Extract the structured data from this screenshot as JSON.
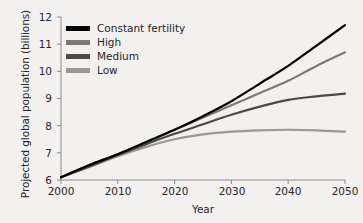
{
  "chart_data": {
    "type": "line",
    "title": "",
    "xlabel": "Year",
    "ylabel": "Projected global population (billions)",
    "xlim": [
      2000,
      2050
    ],
    "ylim": [
      6,
      12
    ],
    "xticks": [
      "2000",
      "2010",
      "2020",
      "2030",
      "2040",
      "2050"
    ],
    "yticks": [
      "6",
      "7",
      "8",
      "9",
      "10",
      "11",
      "12"
    ],
    "grid": false,
    "legend_position": "top-left",
    "x": [
      2000,
      2005,
      2010,
      2015,
      2020,
      2025,
      2030,
      2035,
      2040,
      2045,
      2050
    ],
    "series": [
      {
        "name": "Constant fertility",
        "color": "#000000",
        "values": [
          6.1,
          6.55,
          6.95,
          7.4,
          7.85,
          8.35,
          8.9,
          9.55,
          10.2,
          10.95,
          11.7
        ]
      },
      {
        "name": "High",
        "color": "#7a7a7a",
        "values": [
          6.1,
          6.55,
          6.95,
          7.4,
          7.85,
          8.3,
          8.75,
          9.2,
          9.65,
          10.2,
          10.7
        ]
      },
      {
        "name": "Medium",
        "color": "#4a4a4a",
        "values": [
          6.1,
          6.5,
          6.92,
          7.32,
          7.7,
          8.05,
          8.4,
          8.7,
          8.95,
          9.08,
          9.18
        ]
      },
      {
        "name": "Low",
        "color": "#999999",
        "values": [
          6.1,
          6.48,
          6.88,
          7.22,
          7.5,
          7.68,
          7.78,
          7.83,
          7.85,
          7.83,
          7.78
        ]
      }
    ]
  },
  "legend": {
    "items": [
      {
        "label": "Constant fertility",
        "color": "#000000"
      },
      {
        "label": "High",
        "color": "#7a7a7a"
      },
      {
        "label": "Medium",
        "color": "#4a4a4a"
      },
      {
        "label": "Low",
        "color": "#999999"
      }
    ]
  },
  "axes": {
    "x_title": "Year",
    "y_title": "Projected global population (billions)",
    "x_ticks": [
      "2000",
      "2010",
      "2020",
      "2030",
      "2040",
      "2050"
    ],
    "y_ticks": [
      "12",
      "11",
      "10",
      "9",
      "8",
      "7",
      "6"
    ]
  }
}
